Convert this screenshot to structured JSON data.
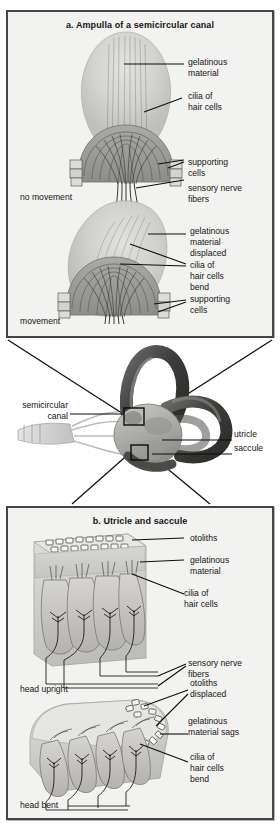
{
  "figure": {
    "kind": "anatomical-diagram",
    "background_color": "#ffffff",
    "panel_fill": "#f2f2f0",
    "panel_border_color": "#444442",
    "ink_color": "#141414"
  },
  "panel_a": {
    "title": "a. Ampulla of a semicircular canal",
    "states": {
      "top_state": "no movement",
      "bottom_state": "movement"
    },
    "labels_top": [
      {
        "id": "gelatinous-material",
        "text": "gelatinous\nmaterial"
      },
      {
        "id": "cilia-of-hair-cells",
        "text": "cilia of\nhair cells"
      },
      {
        "id": "supporting-cells",
        "text": "supporting\ncells"
      },
      {
        "id": "sensory-nerve-fibers",
        "text": "sensory nerve\nfibers"
      }
    ],
    "labels_bottom": [
      {
        "id": "gelatinous-material-displaced",
        "text": "gelatinous\nmaterial\ndisplaced"
      },
      {
        "id": "cilia-of-hair-cells-bend",
        "text": "cilia of\nhair cells\nbend"
      },
      {
        "id": "supporting-cells",
        "text": "supporting\ncells"
      }
    ]
  },
  "middle": {
    "labels": [
      {
        "id": "semicircular-canal",
        "text": "semicircular\ncanal",
        "side": "left"
      },
      {
        "id": "utricle",
        "text": "utricle",
        "side": "right"
      },
      {
        "id": "saccule",
        "text": "saccule",
        "side": "right"
      }
    ]
  },
  "panel_b": {
    "title": "b. Utricle and saccule",
    "states": {
      "top_state": "head upright",
      "bottom_state": "head bent"
    },
    "labels_top": [
      {
        "id": "otoliths",
        "text": "otoliths"
      },
      {
        "id": "gelatinous-material",
        "text": "gelatinous\nmaterial"
      },
      {
        "id": "cilia-of-hair-cells",
        "text": "cilia of\nhair cells"
      },
      {
        "id": "sensory-nerve-fibers",
        "text": "sensory nerve\nfibers"
      }
    ],
    "labels_bottom": [
      {
        "id": "otoliths-displaced",
        "text": "otoliths\ndisplaced"
      },
      {
        "id": "gelatinous-material-sags",
        "text": "gelatinous\nmaterial sags"
      },
      {
        "id": "cilia-of-hair-cells-bend",
        "text": "cilia of\nhair cells\nbend"
      }
    ]
  }
}
